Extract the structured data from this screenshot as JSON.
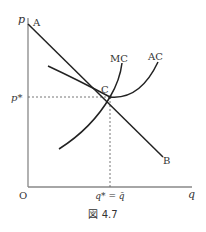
{
  "figure": {
    "caption": "図 4.7",
    "axes": {
      "y_label": "p",
      "x_label": "q",
      "origin_label": "O",
      "y_tick_label": "p*",
      "x_tick_label": "q* = q̄"
    },
    "curves": {
      "demand_line": {
        "start_label": "A",
        "end_label": "B"
      },
      "mc_label": "MC",
      "ac_label": "AC"
    },
    "point_label": "C",
    "colors": {
      "axis": "#888888",
      "curve": "#222222",
      "text": "#333333",
      "dashed": "#666666"
    }
  }
}
